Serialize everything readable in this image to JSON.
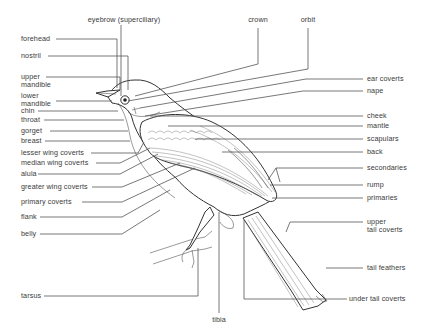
{
  "diagram": {
    "type": "anatomy-diagram",
    "labels_top": [
      {
        "id": "eyebrow",
        "text": "eyebrow (superciliary)"
      },
      {
        "id": "crown",
        "text": "crown"
      },
      {
        "id": "orbit",
        "text": "orbit"
      }
    ],
    "labels_left": [
      {
        "id": "forehead",
        "text": "forehead"
      },
      {
        "id": "nostril",
        "text": "nostril"
      },
      {
        "id": "upper_mandible",
        "line1": "upper",
        "line2": "mandible"
      },
      {
        "id": "lower_mandible",
        "line1": "lower",
        "line2": "mandible"
      },
      {
        "id": "chin",
        "text": "chin"
      },
      {
        "id": "throat",
        "text": "throat"
      },
      {
        "id": "gorget",
        "text": "gorget"
      },
      {
        "id": "breast",
        "text": "breast"
      },
      {
        "id": "lesser_wing_coverts",
        "text": "lesser wing coverts"
      },
      {
        "id": "median_wing_coverts",
        "text": "median wing coverts"
      },
      {
        "id": "alula",
        "text": "alula"
      },
      {
        "id": "greater_wing_coverts",
        "text": "greater wing coverts"
      },
      {
        "id": "primary_coverts",
        "text": "primary coverts"
      },
      {
        "id": "flank",
        "text": "flank"
      },
      {
        "id": "belly",
        "text": "belly"
      },
      {
        "id": "tarsus",
        "text": "tarsus"
      }
    ],
    "labels_right": [
      {
        "id": "ear_coverts",
        "text": "ear coverts"
      },
      {
        "id": "nape",
        "text": "nape"
      },
      {
        "id": "cheek",
        "text": "cheek"
      },
      {
        "id": "mantle",
        "text": "mantle"
      },
      {
        "id": "scapulars",
        "text": "scapulars"
      },
      {
        "id": "back",
        "text": "back"
      },
      {
        "id": "secondaries",
        "text": "secondaries"
      },
      {
        "id": "rump",
        "text": "rump"
      },
      {
        "id": "primaries",
        "text": "primaries"
      },
      {
        "id": "upper_tail_coverts",
        "line1": "upper",
        "line2": "tail coverts"
      },
      {
        "id": "tail_feathers",
        "text": "tail feathers"
      },
      {
        "id": "under_tail_coverts",
        "text": "under tail coverts"
      }
    ],
    "labels_bottom": [
      {
        "id": "tibia",
        "text": "tibia"
      }
    ]
  }
}
